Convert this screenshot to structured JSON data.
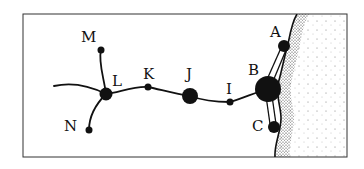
{
  "diagram": {
    "type": "network-map",
    "frame": {
      "x": 23,
      "y": 14,
      "width": 324,
      "height": 143
    },
    "colors": {
      "ink": "#111111",
      "background": "#ffffff",
      "sea_stipple": "#444444"
    },
    "nodes": [
      {
        "id": "A",
        "label": "A",
        "x": 284,
        "y": 46,
        "r": 6,
        "lx": 270,
        "ly": 37
      },
      {
        "id": "B",
        "label": "B",
        "x": 268,
        "y": 89,
        "r": 13,
        "lx": 248,
        "ly": 75
      },
      {
        "id": "C",
        "label": "C",
        "x": 274,
        "y": 127,
        "r": 6,
        "lx": 252,
        "ly": 125
      },
      {
        "id": "I",
        "label": "I",
        "x": 230,
        "y": 102,
        "r": 3.5,
        "lx": 226,
        "ly": 94
      },
      {
        "id": "J",
        "label": "J",
        "x": 190,
        "y": 96,
        "r": 8,
        "lx": 188,
        "ly": 79
      },
      {
        "id": "K",
        "label": "K",
        "x": 148,
        "y": 87,
        "r": 3.5,
        "lx": 146,
        "ly": 79
      },
      {
        "id": "L",
        "label": "L",
        "x": 106,
        "y": 94,
        "r": 6.5,
        "lx": 112,
        "ly": 82
      },
      {
        "id": "M",
        "label": "M",
        "x": 101,
        "y": 50,
        "r": 3.5,
        "lx": 81,
        "ly": 42
      },
      {
        "id": "N",
        "label": "N",
        "x": 89,
        "y": 130,
        "r": 3.5,
        "lx": 65,
        "ly": 131
      }
    ],
    "edges": [
      {
        "from": "L",
        "to": "M",
        "style": "road"
      },
      {
        "from": "L",
        "to": "N",
        "style": "road"
      },
      {
        "from": "L",
        "to": "K",
        "style": "road"
      },
      {
        "from": "K",
        "to": "J",
        "style": "road"
      },
      {
        "from": "J",
        "to": "I",
        "style": "road"
      },
      {
        "from": "I",
        "to": "B",
        "style": "road"
      },
      {
        "from": "B",
        "to": "A",
        "style": "double-line"
      },
      {
        "from": "B",
        "to": "C",
        "style": "double-line"
      },
      {
        "from": "L",
        "to": "west-edge",
        "style": "road"
      }
    ],
    "features": [
      "coastline",
      "sea (stippled, east side)"
    ]
  }
}
